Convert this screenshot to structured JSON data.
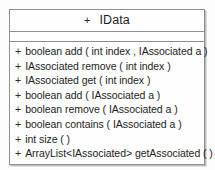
{
  "diagram": {
    "type": "uml-class-diagram",
    "notation": "UML",
    "colors": {
      "border": "#8e8e8e",
      "box_background": "#fefefe",
      "page_background": "#fdfdfd",
      "text": "#1d1d1d"
    }
  },
  "uml_class": {
    "visibility": "+",
    "name": "IData",
    "attributes": [],
    "operations": [
      {
        "visibility": "+",
        "signature": "boolean add ( int index , IAssociated a )"
      },
      {
        "visibility": "+",
        "signature": "IAssociated remove ( int index )"
      },
      {
        "visibility": "+",
        "signature": "IAssociated get ( int index )"
      },
      {
        "visibility": "+",
        "signature": "boolean add ( IAssociated a )"
      },
      {
        "visibility": "+",
        "signature": "boolean remove ( IAssociated a )"
      },
      {
        "visibility": "+",
        "signature": "boolean contains ( IAssociated a )"
      },
      {
        "visibility": "+",
        "signature": "int size ( )"
      },
      {
        "visibility": "+",
        "signature": "ArrayList<IAssociated> getAssociated ( )"
      }
    ]
  }
}
